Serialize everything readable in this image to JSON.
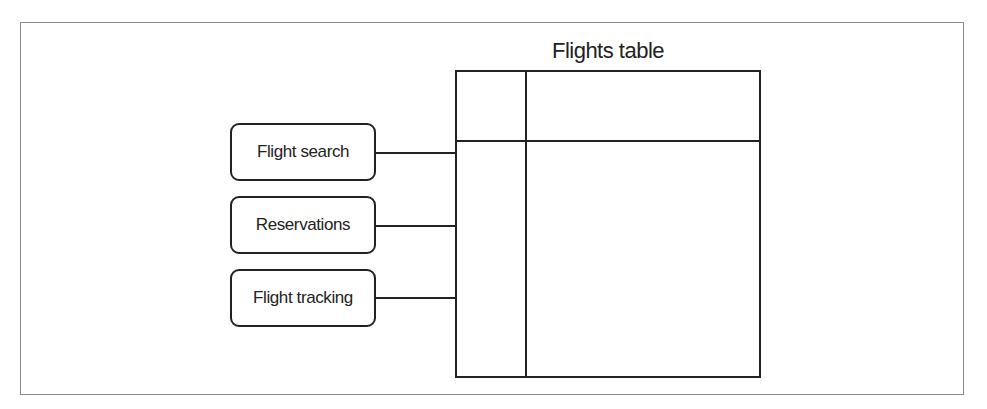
{
  "diagram": {
    "title": "Flights table",
    "table": {
      "label": "Flights table",
      "columns": 2,
      "rows": 2
    },
    "nodes": [
      {
        "label": "Flight search"
      },
      {
        "label": "Reservations"
      },
      {
        "label": "Flight tracking"
      }
    ],
    "edges": [
      {
        "from": "Flight search",
        "to": "Flights table"
      },
      {
        "from": "Reservations",
        "to": "Flights table"
      },
      {
        "from": "Flight tracking",
        "to": "Flights table"
      }
    ],
    "colors": {
      "stroke": "#222222",
      "frame": "#8a8a8a",
      "background": "#ffffff"
    }
  }
}
